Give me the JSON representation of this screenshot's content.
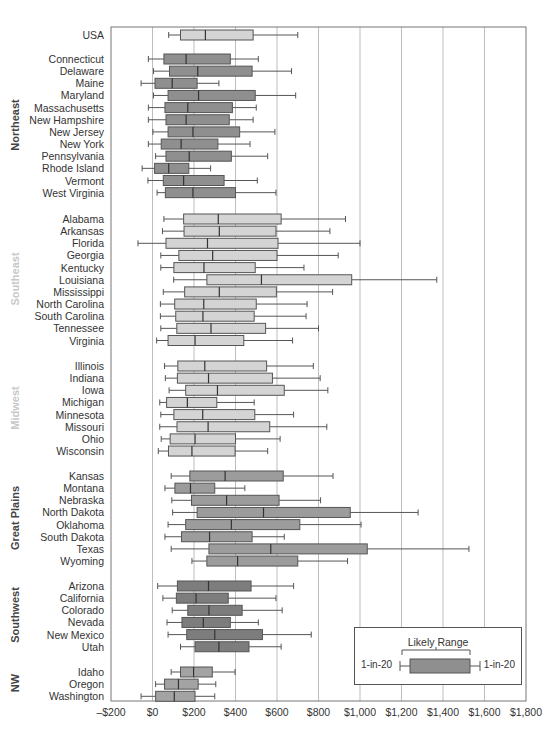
{
  "chart_data": {
    "type": "boxplot",
    "title": "",
    "xlabel": "",
    "ylabel": "",
    "xlim": [
      -200,
      1800
    ],
    "x_ticks": [
      "–$200",
      "$0",
      "$200",
      "$400",
      "$600",
      "$800",
      "$1,000",
      "$1,200",
      "$1,400",
      "$1,600",
      "$1,800"
    ],
    "x_tick_values": [
      -200,
      0,
      200,
      400,
      600,
      800,
      1000,
      1200,
      1400,
      1600,
      1800
    ],
    "grid": "vertical",
    "legend": {
      "title": "Likely Range",
      "left_label": "1-in-20",
      "right_label": "1-in-20",
      "position": "lower right"
    },
    "value_fields": [
      "whisker_low",
      "box_low",
      "median",
      "box_high",
      "whisker_high"
    ],
    "groups": [
      {
        "region": "",
        "color": "#d4d4d4",
        "rows": [
          {
            "name": "USA",
            "values": [
              78,
              135,
              255,
              485,
              700
            ]
          }
        ]
      },
      {
        "region": "Northeast",
        "region_color": "#444444",
        "color": "#8f8f8f",
        "rows": [
          {
            "name": "Connecticut",
            "values": [
              -20,
              55,
              162,
              375,
              510
            ]
          },
          {
            "name": "Delaware",
            "values": [
              5,
              82,
              218,
              480,
              670
            ]
          },
          {
            "name": "Maine",
            "values": [
              -55,
              12,
              95,
              215,
              320
            ]
          },
          {
            "name": "Maryland",
            "values": [
              5,
              75,
              222,
              495,
              690
            ]
          },
          {
            "name": "Massachusetts",
            "values": [
              -20,
              60,
              170,
              385,
              500
            ]
          },
          {
            "name": "New Hampshire",
            "values": [
              -20,
              65,
              162,
              370,
              485
            ]
          },
          {
            "name": "New Jersey",
            "values": [
              2,
              75,
              195,
              420,
              590
            ]
          },
          {
            "name": "New York",
            "values": [
              -20,
              42,
              138,
              315,
              470
            ]
          },
          {
            "name": "Pennsylvania",
            "values": [
              15,
              65,
              177,
              380,
              555
            ]
          },
          {
            "name": "Rhode Island",
            "values": [
              -50,
              10,
              78,
              175,
              280
            ]
          },
          {
            "name": "Vermont",
            "values": [
              -22,
              52,
              150,
              345,
              505
            ]
          },
          {
            "name": "West Virginia",
            "values": [
              22,
              62,
              195,
              400,
              595
            ]
          }
        ]
      },
      {
        "region": "Southeast",
        "region_color": "#c8c8c8",
        "color": "#d4d4d4",
        "rows": [
          {
            "name": "Alabama",
            "values": [
              55,
              150,
              317,
              620,
              930
            ]
          },
          {
            "name": "Arkansas",
            "values": [
              48,
              152,
              322,
              595,
              855
            ]
          },
          {
            "name": "Florida",
            "values": [
              -70,
              65,
              265,
              605,
              1000
            ]
          },
          {
            "name": "Georgia",
            "values": [
              40,
              127,
              290,
              600,
              895
            ]
          },
          {
            "name": "Kentucky",
            "values": [
              40,
              103,
              248,
              495,
              730
            ]
          },
          {
            "name": "Louisiana",
            "values": [
              102,
              262,
              525,
              960,
              1370
            ]
          },
          {
            "name": "Mississippi",
            "values": [
              52,
              155,
              322,
              597,
              868
            ]
          },
          {
            "name": "North Carolina",
            "values": [
              38,
              107,
              247,
              500,
              745
            ]
          },
          {
            "name": "South Carolina",
            "values": [
              38,
              112,
              243,
              490,
              740
            ]
          },
          {
            "name": "Tennessee",
            "values": [
              40,
              117,
              282,
              545,
              800
            ]
          },
          {
            "name": "Virginia",
            "values": [
              20,
              75,
              205,
              440,
              675
            ]
          }
        ]
      },
      {
        "region": "Midwest",
        "region_color": "#c8c8c8",
        "color": "#d4d4d4",
        "rows": [
          {
            "name": "Illinois",
            "values": [
              58,
              122,
              252,
              550,
              775
            ]
          },
          {
            "name": "Indiana",
            "values": [
              62,
              120,
              270,
              578,
              808
            ]
          },
          {
            "name": "Iowa",
            "values": [
              80,
              160,
              313,
              635,
              845
            ]
          },
          {
            "name": "Michigan",
            "values": [
              35,
              68,
              168,
              310,
              490
            ]
          },
          {
            "name": "Minnesota",
            "values": [
              40,
              103,
              242,
              493,
              680
            ]
          },
          {
            "name": "Missouri",
            "values": [
              35,
              118,
              268,
              565,
              840
            ]
          },
          {
            "name": "Ohio",
            "values": [
              42,
              85,
              205,
              400,
              615
            ]
          },
          {
            "name": "Wisconsin",
            "values": [
              28,
              77,
              190,
              398,
              555
            ]
          }
        ]
      },
      {
        "region": "Great Plains",
        "region_color": "#444444",
        "color": "#9c9c9c",
        "rows": [
          {
            "name": "Kansas",
            "values": [
              90,
              180,
              350,
              630,
              870
            ]
          },
          {
            "name": "Montana",
            "values": [
              60,
              108,
              183,
              300,
              445
            ]
          },
          {
            "name": "Nebraska",
            "values": [
              93,
              188,
              357,
              610,
              810
            ]
          },
          {
            "name": "North Dakota",
            "values": [
              97,
              215,
              535,
              953,
              1280
            ]
          },
          {
            "name": "Oklahoma",
            "values": [
              75,
              160,
              380,
              710,
              1005
            ]
          },
          {
            "name": "South Dakota",
            "values": [
              60,
              140,
              275,
              480,
              635
            ]
          },
          {
            "name": "Texas",
            "values": [
              90,
              272,
              570,
              1035,
              1525
            ]
          },
          {
            "name": "Wyoming",
            "values": [
              190,
              262,
              410,
              700,
              940
            ]
          }
        ]
      },
      {
        "region": "Southwest",
        "region_color": "#444444",
        "color": "#7d7d7d",
        "rows": [
          {
            "name": "Arizona",
            "values": [
              25,
              120,
              270,
              475,
              680
            ]
          },
          {
            "name": "California",
            "values": [
              50,
              115,
              210,
              365,
              595
            ]
          },
          {
            "name": "Colorado",
            "values": [
              95,
              170,
              272,
              432,
              625
            ]
          },
          {
            "name": "Nevada",
            "values": [
              70,
              142,
              245,
              375,
              510
            ]
          },
          {
            "name": "New Mexico",
            "values": [
              75,
              165,
              300,
              530,
              765
            ]
          },
          {
            "name": "Utah",
            "values": [
              135,
              205,
              320,
              465,
              620
            ]
          }
        ]
      },
      {
        "region": "NW",
        "region_color": "#444444",
        "color": "#a3a3a3",
        "rows": [
          {
            "name": "Idaho",
            "values": [
              90,
              135,
              198,
              288,
              398
            ]
          },
          {
            "name": "Oregon",
            "values": [
              15,
              58,
              125,
              220,
              305
            ]
          },
          {
            "name": "Washington",
            "values": [
              -55,
              15,
              105,
              205,
              300
            ]
          }
        ]
      }
    ]
  }
}
